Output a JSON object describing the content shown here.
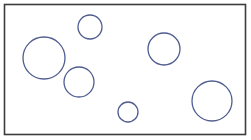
{
  "figure": {
    "width": 251,
    "height": 140,
    "background_color": "#ffffff"
  },
  "frame": {
    "label": "Diagram border frame",
    "x": 4.5,
    "y": 4.5,
    "width": 241,
    "height": 130,
    "stroke_color": "#3c3c3c",
    "stroke_width": 1.6,
    "fill_color": "#ffffff"
  },
  "style": {
    "circle_stroke_color": "#4f5d8f",
    "circle_stroke_width": 1.3,
    "circle_fill": "none"
  },
  "chart_data": {
    "type": "scatter",
    "xlabel": "",
    "ylabel": "",
    "xlim": [
      0,
      251
    ],
    "ylim": [
      0,
      140
    ],
    "grid": false,
    "legend": false,
    "units": "pixels",
    "count": 6,
    "circles": [
      {
        "id": "circle-top-small",
        "label": "small circle top",
        "cx": 90,
        "cy": 27,
        "r": 12
      },
      {
        "id": "circle-left-large",
        "label": "large circle left",
        "cx": 44,
        "cy": 58,
        "r": 21
      },
      {
        "id": "circle-left-medium",
        "label": "medium circle lower left",
        "cx": 79,
        "cy": 82,
        "r": 15
      },
      {
        "id": "circle-right-medium",
        "label": "medium circle upper right",
        "cx": 164,
        "cy": 49,
        "r": 16
      },
      {
        "id": "circle-bottom-small",
        "label": "small circle bottom center",
        "cx": 128,
        "cy": 112,
        "r": 10
      },
      {
        "id": "circle-bottom-right-large",
        "label": "large circle bottom right",
        "cx": 212,
        "cy": 101,
        "r": 20
      }
    ]
  }
}
